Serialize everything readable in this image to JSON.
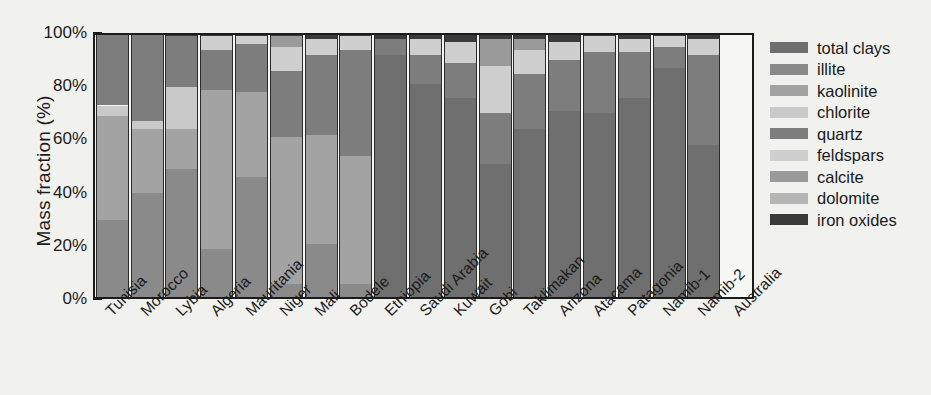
{
  "chart_data": {
    "type": "bar",
    "stacked": true,
    "title": "",
    "subtitle": "",
    "xlabel": "",
    "ylabel": "Mass fraction (%)",
    "ylim": [
      0,
      100
    ],
    "ytick_labels": [
      "0%",
      "20%",
      "40%",
      "60%",
      "80%",
      "100%"
    ],
    "ytick_values": [
      0,
      20,
      40,
      60,
      80,
      100
    ],
    "yminor_step": 10,
    "grid": false,
    "legend_position": "right",
    "categories": [
      "Tunisia",
      "Morocco",
      "Lybia",
      "Algeria",
      "Mauritania",
      "Niger",
      "Mali",
      "Bodele",
      "Ethiopia",
      "Saudi Arabia",
      "Kuwait",
      "Gobi",
      "Taklimakan",
      "Arizona",
      "Atacama",
      "Patagonia",
      "Namib-1",
      "Namib-2",
      "Australia"
    ],
    "series": [
      {
        "name": "total clays",
        "color": "#6f6f6f",
        "values": [
          0,
          0,
          0,
          0,
          0,
          0,
          0,
          0,
          91,
          80,
          75,
          50,
          63,
          70,
          69,
          75,
          86,
          57,
          0
        ]
      },
      {
        "name": "illite",
        "color": "#8a8a8a",
        "values": [
          29,
          39,
          48,
          18,
          45,
          5,
          20,
          5,
          0,
          0,
          0,
          0,
          0,
          0,
          0,
          0,
          0,
          0,
          0
        ]
      },
      {
        "name": "kaolinite",
        "color": "#a3a3a3",
        "values": [
          39,
          24,
          15,
          60,
          32,
          55,
          41,
          48,
          0,
          0,
          0,
          0,
          0,
          0,
          0,
          0,
          0,
          0,
          0
        ]
      },
      {
        "name": "chlorite",
        "color": "#c9c9c9",
        "values": [
          4,
          3,
          16,
          0,
          0,
          0,
          0,
          0,
          0,
          0,
          0,
          0,
          0,
          0,
          0,
          0,
          0,
          0,
          0
        ]
      },
      {
        "name": "quartz",
        "color": "#7d7d7d",
        "values": [
          27,
          33,
          19,
          15,
          18,
          25,
          30,
          40,
          6,
          11,
          13,
          19,
          21,
          19,
          23,
          17,
          8,
          34,
          0
        ]
      },
      {
        "name": "feldspars",
        "color": "#cfcfcf",
        "values": [
          0,
          0,
          0,
          5,
          3,
          9,
          6,
          5,
          0,
          6,
          8,
          18,
          9,
          7,
          6,
          5,
          4,
          6,
          0
        ]
      },
      {
        "name": "calcite",
        "color": "#9a9a9a",
        "values": [
          0,
          0,
          0,
          0,
          0,
          4,
          0,
          0,
          0,
          0,
          0,
          10,
          4,
          0,
          0,
          0,
          0,
          0,
          0
        ]
      },
      {
        "name": "dolomite",
        "color": "#b5b5b5",
        "values": [
          0,
          0,
          0,
          0,
          0,
          0,
          0,
          0,
          0,
          0,
          0,
          0,
          0,
          0,
          0,
          0,
          0,
          0,
          0
        ]
      },
      {
        "name": "iron oxides",
        "color": "#3a3a3a",
        "values": [
          1,
          1,
          2,
          2,
          2,
          2,
          3,
          2,
          3,
          3,
          4,
          3,
          3,
          4,
          2,
          3,
          2,
          3,
          0
        ]
      }
    ]
  },
  "legend": {
    "items": [
      {
        "label": "total clays",
        "color": "#6f6f6f"
      },
      {
        "label": "illite",
        "color": "#8a8a8a"
      },
      {
        "label": "kaolinite",
        "color": "#a3a3a3"
      },
      {
        "label": "chlorite",
        "color": "#c9c9c9"
      },
      {
        "label": "quartz",
        "color": "#7d7d7d"
      },
      {
        "label": "feldspars",
        "color": "#cfcfcf"
      },
      {
        "label": "calcite",
        "color": "#9a9a9a"
      },
      {
        "label": "dolomite",
        "color": "#b5b5b5"
      },
      {
        "label": "iron oxides",
        "color": "#3a3a3a"
      }
    ]
  },
  "axes": {
    "y_title": "Mass fraction (%)"
  }
}
